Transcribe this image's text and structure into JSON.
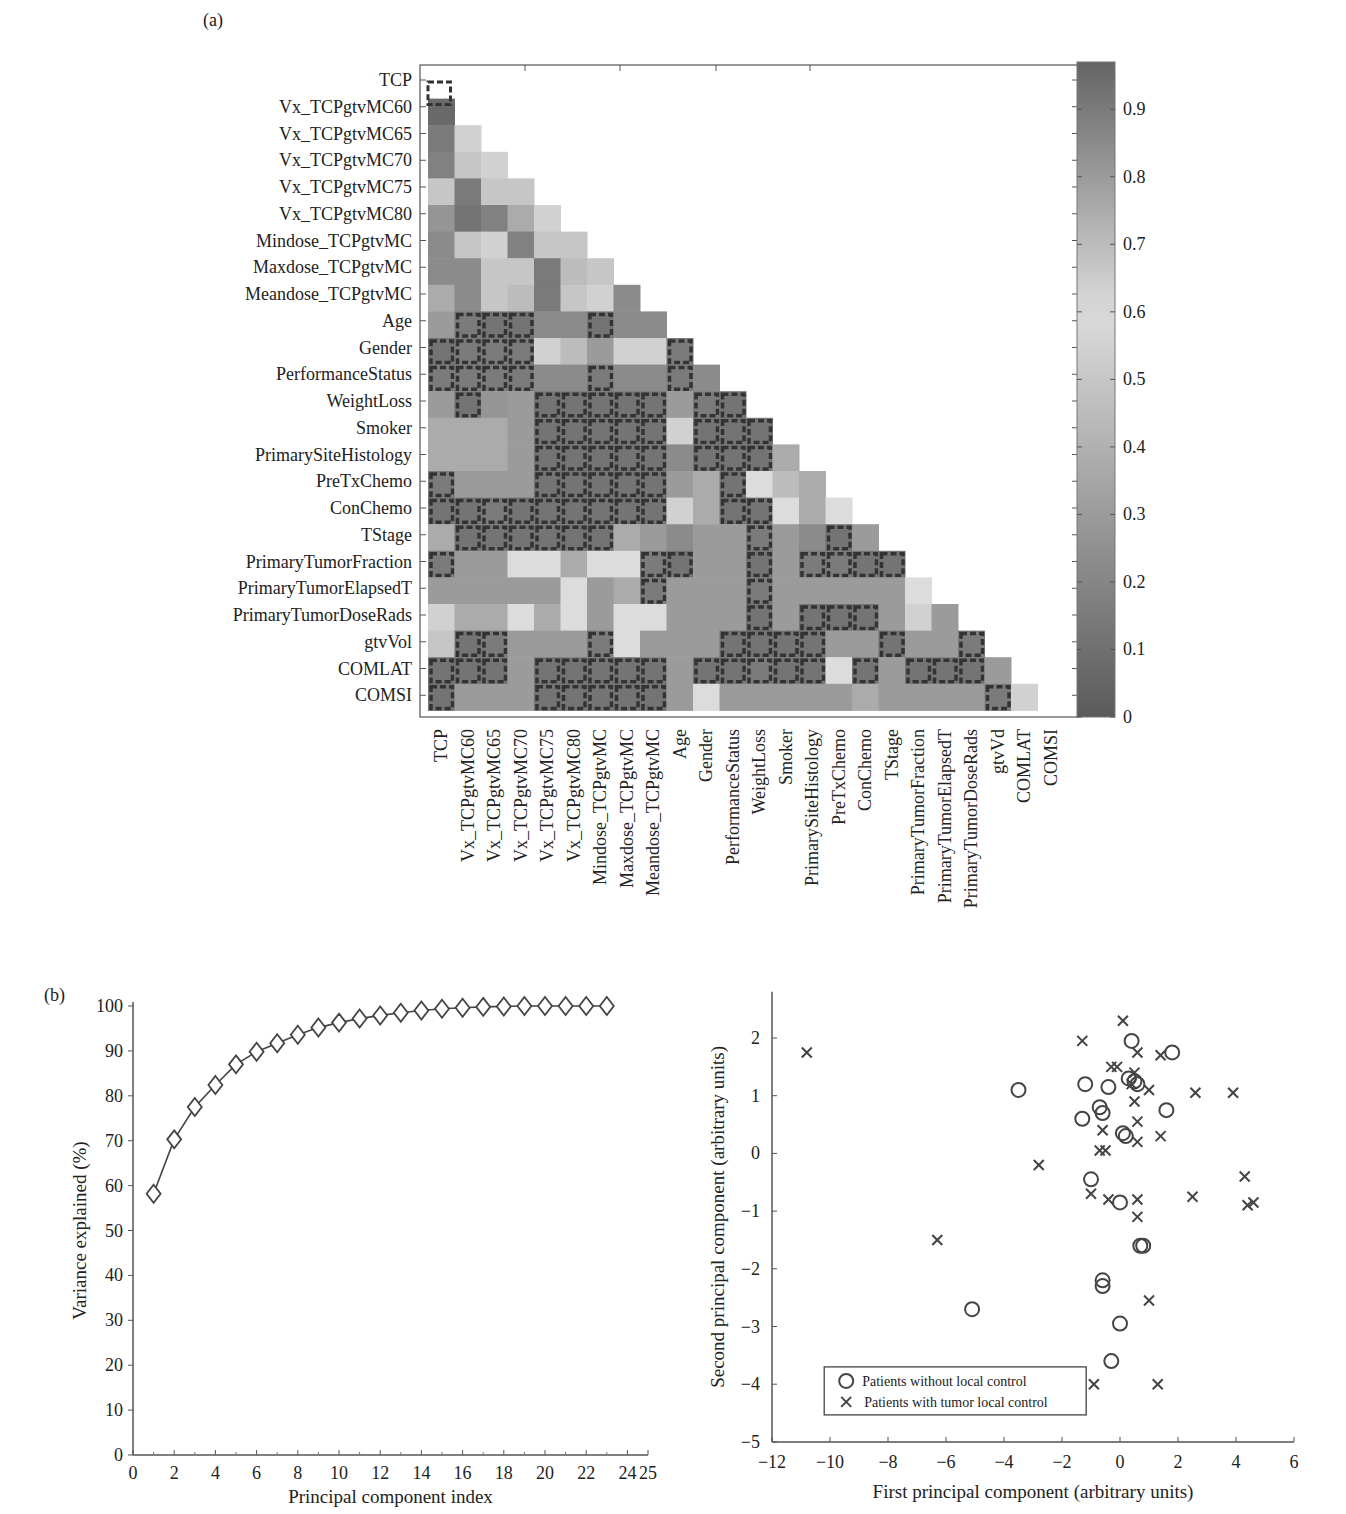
{
  "panel_a_label": "(a)",
  "panel_b_label": "(b)",
  "chart_data": [
    {
      "type": "heatmap",
      "title": "",
      "row_labels": [
        "TCP",
        "Vx_TCPgtvMC60",
        "Vx_TCPgtvMC65",
        "Vx_TCPgtvMC70",
        "Vx_TCPgtvMC75",
        "Vx_TCPgtvMC80",
        "Mindose_TCPgtvMC",
        "Maxdose_TCPgtvMC",
        "Meandose_TCPgtvMC",
        "Age",
        "Gender",
        "PerformanceStatus",
        "WeightLoss",
        "Smoker",
        "PrimarySiteHistology",
        "PreTxChemo",
        "ConChemo",
        "TStage",
        "PrimaryTumorFraction",
        "PrimaryTumorElapsedT",
        "PrimaryTumorDoseRads",
        "gtvVol",
        "COMLAT",
        "COMSI"
      ],
      "col_labels": [
        "TCP",
        "Vx_TCPgtvMC60",
        "Vx_TCPgtvMC65",
        "Vx_TCPgtvMC70",
        "Vx_TCPgtvMC75",
        "Vx_TCPgtvMC80",
        "Mindose_TCPgtvMC",
        "Maxdose_TCPgtvMC",
        "Meandose_TCPgtvMC",
        "Age",
        "Gender",
        "PerformanceStatus",
        "WeightLoss",
        "Smoker",
        "PrimarySiteHistology",
        "PreTxChemo",
        "ConChemo",
        "TStage",
        "PrimaryTumorFraction",
        "PrimaryTumorElapsedT",
        "PrimaryTumorDoseRads",
        "gtvVd",
        "COMLAT",
        "COMSI"
      ],
      "colorbar": {
        "min": 0,
        "max": 0.97,
        "ticks": [
          0,
          0.1,
          0.2,
          0.3,
          0.4,
          0.5,
          0.6,
          0.7,
          0.8,
          0.9
        ]
      },
      "note": "Lower-triangular correlation matrix; values estimated from grayscale; boxed (dashed) cells mark non-significant correlations.",
      "values": [
        [],
        [
          0.95
        ],
        [
          0.9,
          0.55
        ],
        [
          0.88,
          0.5,
          0.55
        ],
        [
          0.5,
          0.9,
          0.5,
          0.5
        ],
        [
          0.82,
          0.92,
          0.88,
          0.75,
          0.55
        ],
        [
          0.85,
          0.5,
          0.55,
          0.88,
          0.5,
          0.5
        ],
        [
          0.85,
          0.85,
          0.5,
          0.5,
          0.9,
          0.7,
          0.5
        ],
        [
          0.75,
          0.85,
          0.5,
          0.7,
          0.9,
          0.5,
          0.55,
          0.85
        ],
        [
          0.8,
          0.15,
          0.12,
          0.12,
          0.85,
          0.85,
          0.12,
          0.85,
          0.85
        ],
        [
          0.12,
          0.15,
          0.15,
          0.15,
          0.55,
          0.7,
          0.3,
          0.55,
          0.55,
          0.15
        ],
        [
          0.15,
          0.15,
          0.15,
          0.15,
          0.85,
          0.85,
          0.15,
          0.85,
          0.85,
          0.15,
          0.85
        ],
        [
          0.8,
          0.12,
          0.82,
          0.8,
          0.12,
          0.12,
          0.12,
          0.12,
          0.12,
          0.8,
          0.15,
          0.12
        ],
        [
          0.75,
          0.75,
          0.75,
          0.8,
          0.12,
          0.12,
          0.12,
          0.12,
          0.12,
          0.55,
          0.12,
          0.12,
          0.12
        ],
        [
          0.75,
          0.75,
          0.75,
          0.8,
          0.12,
          0.12,
          0.12,
          0.12,
          0.12,
          0.85,
          0.12,
          0.12,
          0.12,
          0.75
        ],
        [
          0.15,
          0.8,
          0.8,
          0.8,
          0.12,
          0.12,
          0.12,
          0.12,
          0.12,
          0.8,
          0.75,
          0.12,
          0.6,
          0.7,
          0.75
        ],
        [
          0.12,
          0.12,
          0.15,
          0.12,
          0.12,
          0.12,
          0.12,
          0.12,
          0.12,
          0.55,
          0.75,
          0.12,
          0.12,
          0.6,
          0.75,
          0.6
        ],
        [
          0.75,
          0.12,
          0.12,
          0.12,
          0.12,
          0.12,
          0.12,
          0.75,
          0.8,
          0.85,
          0.8,
          0.8,
          0.15,
          0.8,
          0.85,
          0.12,
          0.8
        ],
        [
          0.15,
          0.8,
          0.8,
          0.6,
          0.6,
          0.75,
          0.6,
          0.6,
          0.15,
          0.12,
          0.8,
          0.8,
          0.12,
          0.8,
          0.15,
          0.15,
          0.12,
          0.12
        ],
        [
          0.8,
          0.8,
          0.8,
          0.8,
          0.8,
          0.6,
          0.8,
          0.75,
          0.15,
          0.8,
          0.8,
          0.8,
          0.15,
          0.8,
          0.8,
          0.8,
          0.8,
          0.8,
          0.6
        ],
        [
          0.55,
          0.75,
          0.75,
          0.6,
          0.75,
          0.6,
          0.8,
          0.6,
          0.6,
          0.8,
          0.8,
          0.8,
          0.12,
          0.8,
          0.12,
          0.12,
          0.12,
          0.8,
          0.55,
          0.8
        ],
        [
          0.5,
          0.12,
          0.15,
          0.8,
          0.8,
          0.8,
          0.15,
          0.6,
          0.8,
          0.8,
          0.8,
          0.12,
          0.12,
          0.12,
          0.12,
          0.8,
          0.8,
          0.12,
          0.8,
          0.8,
          0.15
        ],
        [
          0.12,
          0.12,
          0.12,
          0.8,
          0.12,
          0.12,
          0.12,
          0.12,
          0.12,
          0.8,
          0.12,
          0.12,
          0.15,
          0.12,
          0.12,
          0.6,
          0.12,
          0.8,
          0.12,
          0.12,
          0.12,
          0.8
        ],
        [
          0.12,
          0.8,
          0.8,
          0.8,
          0.12,
          0.12,
          0.12,
          0.12,
          0.12,
          0.8,
          0.6,
          0.8,
          0.8,
          0.8,
          0.8,
          0.8,
          0.75,
          0.8,
          0.8,
          0.8,
          0.8,
          0.15,
          0.55
        ]
      ]
    },
    {
      "type": "line",
      "title": "",
      "xlabel": "Principal component index",
      "ylabel": "Variance explained (%)",
      "xlim": [
        0,
        25
      ],
      "ylim": [
        0,
        100
      ],
      "xticks": [
        0,
        2,
        4,
        6,
        8,
        10,
        12,
        14,
        16,
        18,
        20,
        22,
        24,
        25
      ],
      "yticks": [
        0,
        10,
        20,
        30,
        40,
        50,
        60,
        70,
        80,
        90,
        100
      ],
      "marker": "diamond",
      "x": [
        1,
        2,
        3,
        4,
        5,
        6,
        7,
        8,
        9,
        10,
        11,
        12,
        13,
        14,
        15,
        16,
        17,
        18,
        19,
        20,
        21,
        22,
        23
      ],
      "series": [
        {
          "name": "Cumulative variance explained",
          "values": [
            58.2,
            70.3,
            77.5,
            82.4,
            87.0,
            89.8,
            91.7,
            93.6,
            95.2,
            96.3,
            97.2,
            97.9,
            98.5,
            99.0,
            99.4,
            99.6,
            99.8,
            99.9,
            100,
            100,
            100,
            100,
            100
          ]
        }
      ]
    },
    {
      "type": "scatter",
      "title": "",
      "xlabel": "First principal component (arbitrary units)",
      "ylabel": "Second principal component (arbitrary units)",
      "xlim": [
        -12,
        6
      ],
      "ylim": [
        -5,
        2.8
      ],
      "xticks": [
        -12,
        -10,
        -8,
        -6,
        -4,
        -2,
        0,
        2,
        4,
        6
      ],
      "yticks": [
        -5,
        -4,
        -3,
        -2,
        -1,
        0,
        1,
        2
      ],
      "legend_position": "lower left",
      "series": [
        {
          "name": "Patients without local control",
          "marker": "o",
          "points": [
            [
              -3.5,
              1.1
            ],
            [
              -1.2,
              1.2
            ],
            [
              -0.4,
              1.15
            ],
            [
              -0.7,
              0.8
            ],
            [
              -0.6,
              0.7
            ],
            [
              -1.3,
              0.6
            ],
            [
              0.4,
              1.95
            ],
            [
              0.3,
              1.3
            ],
            [
              0.5,
              1.25
            ],
            [
              0.6,
              1.2
            ],
            [
              1.8,
              1.75
            ],
            [
              1.6,
              0.75
            ],
            [
              0.1,
              0.35
            ],
            [
              0.2,
              0.3
            ],
            [
              -1.0,
              -0.45
            ],
            [
              0,
              -0.85
            ],
            [
              0.7,
              -1.6
            ],
            [
              0.8,
              -1.6
            ],
            [
              -0.6,
              -2.2
            ],
            [
              -0.6,
              -2.3
            ],
            [
              -5.1,
              -2.7
            ],
            [
              0.0,
              -2.95
            ],
            [
              -0.3,
              -3.6
            ]
          ]
        },
        {
          "name": "Patients with tumor local control",
          "marker": "x",
          "points": [
            [
              -10.8,
              1.75
            ],
            [
              -1.3,
              1.95
            ],
            [
              0.1,
              2.3
            ],
            [
              0.6,
              1.75
            ],
            [
              1.4,
              1.7
            ],
            [
              -0.3,
              1.5
            ],
            [
              -0.1,
              1.5
            ],
            [
              0.5,
              1.4
            ],
            [
              0.4,
              1.2
            ],
            [
              1.0,
              1.1
            ],
            [
              2.6,
              1.05
            ],
            [
              3.9,
              1.05
            ],
            [
              0.5,
              0.9
            ],
            [
              0.6,
              0.55
            ],
            [
              -0.6,
              0.4
            ],
            [
              0.6,
              0.2
            ],
            [
              1.4,
              0.3
            ],
            [
              -0.7,
              0.05
            ],
            [
              -0.5,
              0.05
            ],
            [
              -2.8,
              -0.2
            ],
            [
              -1.0,
              -0.7
            ],
            [
              -0.4,
              -0.8
            ],
            [
              0.6,
              -0.8
            ],
            [
              2.5,
              -0.75
            ],
            [
              4.3,
              -0.4
            ],
            [
              4.4,
              -0.9
            ],
            [
              4.6,
              -0.85
            ],
            [
              0.6,
              -1.1
            ],
            [
              -6.3,
              -1.5
            ],
            [
              1.0,
              -2.55
            ],
            [
              -0.9,
              -4.0
            ],
            [
              1.3,
              -4.0
            ]
          ]
        }
      ]
    }
  ]
}
